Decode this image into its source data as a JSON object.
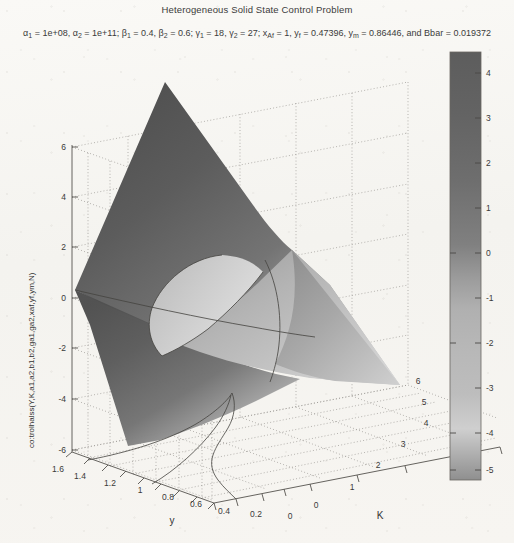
{
  "figure": {
    "title": "Heterogeneous Solid State Control Problem",
    "subtitle_plain": "α1 = 1e+08, α2 = 1e+11; β1 = 0.4, β2 = 0.6; γ1 = 18, γ2 = 27; xAf = 1, yf = 0.47396, ym = 0.86446, and Bbar = 0.019372",
    "background_color": "#f7f6f3",
    "axis_color": "#55524e",
    "grid_color": "#9a9792",
    "surface_dark": "#5e5e5e",
    "surface_light": "#c9c9c9"
  },
  "subtitle_tokens": [
    {
      "base": "α",
      "sub": "1",
      "tail": " = 1e+08, "
    },
    {
      "base": "α",
      "sub": "2",
      "tail": " = 1e+11; "
    },
    {
      "base": "β",
      "sub": "1",
      "tail": " = 0.4, "
    },
    {
      "base": "β",
      "sub": "2",
      "tail": " = 0.6; "
    },
    {
      "base": "γ",
      "sub": "1",
      "tail": " = 18, "
    },
    {
      "base": "γ",
      "sub": "2",
      "tail": " = 27; "
    },
    {
      "base": "x",
      "sub": "Af",
      "tail": " = 1, "
    },
    {
      "base": "y",
      "sub": "f",
      "tail": " = 0.47396, "
    },
    {
      "base": "y",
      "sub": "m",
      "tail": " = 0.86446, and Bbar = 0.019372"
    }
  ],
  "chart_data": {
    "type": "surface",
    "title": "Heterogeneous Solid State Control Problem",
    "xlabel": "y",
    "ylabel": "K",
    "zlabel": "co:trolhalss(Y,K,a1,a2,b1,b2,ga1,ga2,xaf,yf,ym,N)",
    "xlim": [
      0,
      1.6
    ],
    "ylim": [
      0,
      6
    ],
    "zlim": [
      -6,
      6
    ],
    "xticks": [
      "1.6",
      "1.4",
      "1.2",
      "1",
      "0.8",
      "0.6",
      "0.4",
      "0.2",
      "0"
    ],
    "yticks": [
      "0",
      "1",
      "2",
      "3",
      "4",
      "5",
      "6"
    ],
    "zticks": [
      "6",
      "4",
      "2",
      "0",
      "-2",
      "-4",
      "-6"
    ],
    "grid": true,
    "view": "3d-rotated",
    "colormap": "gray",
    "colorbar": {
      "position": "right",
      "ticks": [
        "4",
        "3",
        "2",
        "1",
        "0",
        "-1",
        "-2",
        "-3",
        "-4",
        "-5"
      ],
      "range": [
        -5.6,
        4.6
      ]
    }
  },
  "axes": {
    "x_axis_label": "y",
    "y_axis_label": "K",
    "z_axis_label": "co:trolhalss(Y,K,a1,a2,b1,b2,ga1,ga2,xaf,yf,ym,N)"
  }
}
